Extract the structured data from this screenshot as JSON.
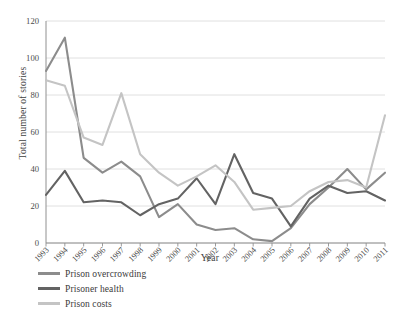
{
  "chart_data": {
    "type": "line",
    "title": "",
    "xlabel": "Year",
    "ylabel": "Total number of stories",
    "categories": [
      "1993",
      "1994",
      "1995",
      "1996",
      "1997",
      "1998",
      "1999",
      "2000",
      "2001",
      "2002",
      "2003",
      "2004",
      "2005",
      "2006",
      "2007",
      "2008",
      "2009",
      "2010",
      "2011"
    ],
    "x": [
      1993,
      1994,
      1995,
      1996,
      1997,
      1998,
      1999,
      2000,
      2001,
      2002,
      2003,
      2004,
      2005,
      2006,
      2007,
      2008,
      2009,
      2010,
      2011
    ],
    "ylim": [
      0,
      120
    ],
    "yticks": [
      0,
      20,
      40,
      60,
      80,
      100,
      120
    ],
    "grid": true,
    "legend_position": "below-left",
    "series": [
      {
        "name": "Prison overcrowding",
        "color": "#8c8c8c",
        "values": [
          93,
          111,
          46,
          38,
          44,
          36,
          14,
          21,
          10,
          7,
          8,
          2,
          1,
          8,
          21,
          30,
          40,
          29,
          38
        ]
      },
      {
        "name": "Prisoner health",
        "color": "#636363",
        "values": [
          26,
          39,
          22,
          23,
          22,
          15,
          21,
          24,
          35,
          21,
          48,
          27,
          24,
          9,
          24,
          31,
          27,
          28,
          23
        ]
      },
      {
        "name": "Prison costs",
        "color": "#c4c4c4",
        "values": [
          88,
          85,
          57,
          53,
          81,
          48,
          38,
          31,
          36,
          42,
          33,
          18,
          19,
          20,
          28,
          33,
          34,
          30,
          69
        ]
      }
    ]
  },
  "legend": {
    "items": [
      {
        "label": "Prison overcrowding",
        "color": "#8c8c8c"
      },
      {
        "label": "Prisoner health",
        "color": "#636363"
      },
      {
        "label": "Prison costs",
        "color": "#c4c4c4"
      }
    ]
  },
  "axes": {
    "y_title": "Total number of stories",
    "x_title": "Year"
  },
  "style": {
    "grid_color": "#dcdcdc",
    "axis_color": "#909090",
    "background": "#ffffff"
  }
}
